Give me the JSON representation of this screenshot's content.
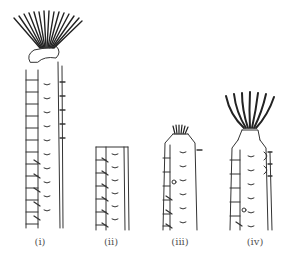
{
  "figure": {
    "corner_text": "",
    "colors": {
      "ink": "#333333",
      "background": "#ffffff"
    },
    "specimens": [
      {
        "id": "i",
        "label": "(i)",
        "description": "long segmented tube worm with large spreading tentacle crown and collar"
      },
      {
        "id": "ii",
        "label": "(ii)",
        "description": "short segmented tube body fragment, no crown"
      },
      {
        "id": "iii",
        "label": "(iii)",
        "description": "segmented tube worm with small retracted tentacle tuft"
      },
      {
        "id": "iv",
        "label": "(iv)",
        "description": "segmented tube worm with expanded cup-shaped tentacle crown"
      }
    ]
  }
}
